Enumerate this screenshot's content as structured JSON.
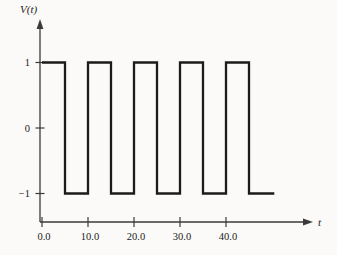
{
  "figure": {
    "background": "#fbfaf8",
    "wave_color": "#1b1b1b",
    "axis_color": "#3a3a3a",
    "text_color": "#222222"
  },
  "chart_data": {
    "type": "line",
    "subtype": "square-wave",
    "title": "",
    "xlabel": "t",
    "ylabel": "V(t)",
    "grid": false,
    "legend": false,
    "xlim": [
      0,
      55
    ],
    "ylim": [
      -1.5,
      1.5
    ],
    "x_ticks": {
      "values": [
        0,
        10,
        20,
        30,
        40
      ],
      "labels": [
        "0.0",
        "10.0",
        "20.0",
        "30.0",
        "40.0"
      ]
    },
    "y_ticks": {
      "values": [
        1,
        0,
        -1
      ],
      "labels": [
        "1",
        "0",
        "−1"
      ]
    },
    "series": [
      {
        "name": "V(t)",
        "shape": "square wave, amplitude ±1, period 10, 50% duty cycle, starts high at t=0, ends low at t≈50.5",
        "points": [
          [
            0,
            1
          ],
          [
            5,
            1
          ],
          [
            5,
            -1
          ],
          [
            10,
            -1
          ],
          [
            10,
            1
          ],
          [
            15,
            1
          ],
          [
            15,
            -1
          ],
          [
            20,
            -1
          ],
          [
            20,
            1
          ],
          [
            25,
            1
          ],
          [
            25,
            -1
          ],
          [
            30,
            -1
          ],
          [
            30,
            1
          ],
          [
            35,
            1
          ],
          [
            35,
            -1
          ],
          [
            40,
            -1
          ],
          [
            40,
            1
          ],
          [
            45,
            1
          ],
          [
            45,
            -1
          ],
          [
            50.5,
            -1
          ]
        ]
      }
    ]
  }
}
